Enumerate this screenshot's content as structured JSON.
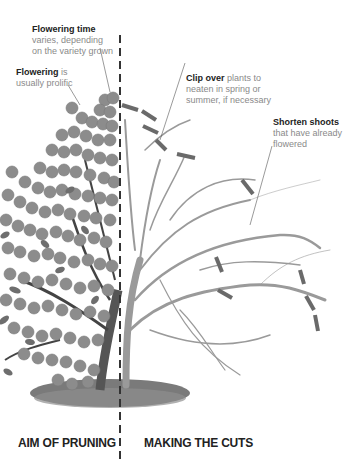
{
  "annotations": {
    "flowering_time": {
      "bold": "Flowering time",
      "line1": "varies, depending",
      "line2": "on the variety grown"
    },
    "flowering": {
      "bold": "Flowering",
      "rest": " is",
      "line2": "usually prolific"
    },
    "clip_over": {
      "bold": "Clip over",
      "rest": " plants to",
      "line2": "neaten in spring or",
      "line3": "summer, if necessary"
    },
    "shorten_shoots": {
      "bold": "Shorten shoots",
      "line2": "that have already",
      "line3": "flowered"
    }
  },
  "captions": {
    "left": "AIM OF PRUNING",
    "right": "MAKING THE CUTS"
  },
  "colors": {
    "flower": "#8c8c8c",
    "leaf": "#6e6e6e",
    "branch_bare": "#9a9a9a",
    "trunk": "#555555",
    "cut_mark": "#6a6a6a",
    "divider": "#333333",
    "ground": "#7a7a7a"
  }
}
